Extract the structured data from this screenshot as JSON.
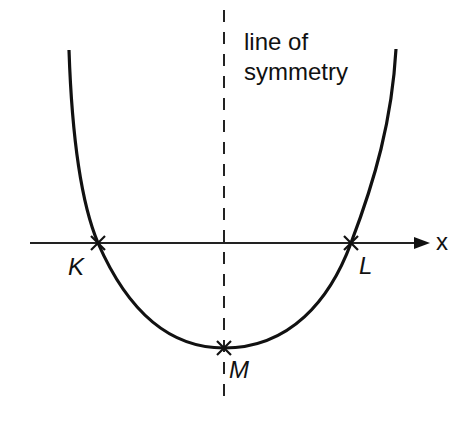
{
  "diagram": {
    "symmetry_label_line1": "line of",
    "symmetry_label_line2": "symmetry",
    "axis_label": "x",
    "points": [
      {
        "name": "K",
        "x": 98,
        "y": 243
      },
      {
        "name": "L",
        "x": 351,
        "y": 243
      },
      {
        "name": "M",
        "x": 224,
        "y": 348
      }
    ],
    "colors": {
      "stroke": "#111111",
      "background": "#ffffff"
    }
  }
}
